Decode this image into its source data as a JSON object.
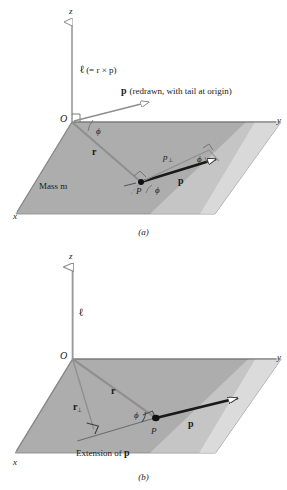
{
  "figure": {
    "colors": {
      "plane_fill": "#adadad",
      "plane_edge": "#6e6e6e",
      "axis": "#8a8a8a",
      "vector_gray": "#8f8f8f",
      "vector_black": "#1a1a1a",
      "text": "#1a1a1a",
      "background": "#ffffff"
    }
  },
  "panel_a": {
    "caption": "(a)",
    "axes": {
      "z": "z",
      "y": "y",
      "x": "x"
    },
    "origin_label": "O",
    "labels": {
      "ell_expr_bold": "ℓ",
      "ell_expr_rest": "(= r × p)",
      "p_redrawn_vec": "p",
      "p_redrawn_rest": "(redrawn, with tail at origin)",
      "r_vector": "r",
      "p_vector": "p",
      "p_perp": "p",
      "p_perp_sub": "⊥",
      "mass_label": "Mass m",
      "point_label": "P",
      "phi_origin": "ϕ",
      "phi_at_p": "ϕ",
      "phi_triangle": "ϕ"
    }
  },
  "panel_b": {
    "caption": "(b)",
    "axes": {
      "z": "z",
      "y": "y",
      "x": "x"
    },
    "origin_label": "O",
    "labels": {
      "ell_vector": "ℓ",
      "r_vector": "r",
      "r_perp": "r",
      "r_perp_sub": "⊥",
      "p_vector": "p",
      "point_label": "P",
      "phi_at_p": "ϕ",
      "extension_text": "Extension of ",
      "extension_vec": "p"
    }
  }
}
